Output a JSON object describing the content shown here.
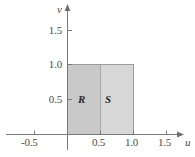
{
  "figure": {
    "type": "math-diagram"
  },
  "axes": {
    "x_axis": {
      "name": "u",
      "ticks": [
        "-0.5",
        "0.5",
        "1.0",
        "1.5"
      ],
      "tick_values": [
        -0.5,
        0.5,
        1.0,
        1.5
      ],
      "range": [
        -0.75,
        1.75
      ],
      "arrow": true
    },
    "y_axis": {
      "name": "v",
      "ticks": [
        "0.5",
        "1.0",
        "1.5"
      ],
      "tick_values": [
        0.5,
        1.0,
        1.5
      ],
      "range": [
        -0.15,
        1.8
      ],
      "arrow": true
    }
  },
  "regions": [
    {
      "label": "R",
      "u_range": [
        0,
        0.5
      ],
      "v_range": [
        0,
        1.0
      ],
      "fill": "#c9c9c9"
    },
    {
      "label": "S",
      "u_range": [
        0.5,
        1.0
      ],
      "v_range": [
        0,
        1.0
      ],
      "fill": "#d6d6d6"
    }
  ],
  "colors": {
    "axis": "#7a7a7a",
    "outline": "#9a9a9a",
    "divider": "#a8a8a8",
    "text": "#4a4a4a",
    "region_text": "#2b2b2b",
    "background": "#ffffff"
  }
}
